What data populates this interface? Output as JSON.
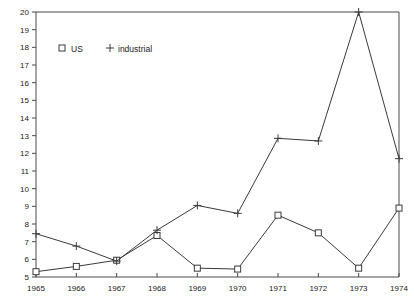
{
  "chart_data": {
    "type": "line",
    "title": "",
    "xlabel": "",
    "ylabel": "",
    "categories": [
      "1965",
      "1966",
      "1967",
      "1968",
      "1969",
      "1970",
      "1971",
      "1972",
      "1973",
      "1974"
    ],
    "x": [
      1965,
      1966,
      1967,
      1968,
      1969,
      1970,
      1971,
      1972,
      1973,
      1974
    ],
    "xlim": [
      1965,
      1974
    ],
    "ylim": [
      5,
      20
    ],
    "y_ticks": [
      5,
      6,
      7,
      8,
      9,
      10,
      11,
      12,
      13,
      14,
      15,
      16,
      17,
      18,
      19,
      20
    ],
    "x_ticks": [
      "1965",
      "1966",
      "1967",
      "1968",
      "1969",
      "1970",
      "1971",
      "1972",
      "1973",
      "1974"
    ],
    "grid": false,
    "legend_position": "top-left",
    "series": [
      {
        "name": "US",
        "marker": "square",
        "values": [
          5.3,
          5.6,
          5.95,
          7.35,
          5.5,
          5.45,
          8.5,
          7.5,
          5.5,
          8.9
        ]
      },
      {
        "name": "industrial",
        "marker": "plus",
        "values": [
          7.45,
          6.75,
          5.9,
          7.65,
          9.05,
          8.6,
          12.85,
          12.7,
          20.0,
          11.7
        ]
      }
    ]
  },
  "legend": {
    "entries": [
      {
        "marker_name": "square-marker",
        "label": "US"
      },
      {
        "marker_name": "plus-marker",
        "label": "industrial"
      }
    ]
  },
  "colors": {
    "line": "#3a3a3a",
    "axis": "#4a4a4a",
    "text": "#1a1a1a",
    "background": "#ffffff"
  }
}
